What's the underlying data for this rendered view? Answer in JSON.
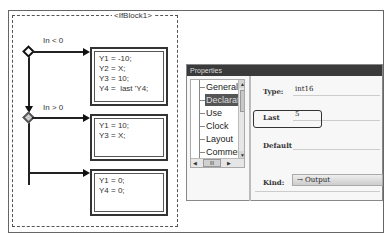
{
  "diagram": {
    "block_label": "<IfBlock1>",
    "branches": [
      {
        "condition": "In < 0",
        "statements": [
          "Y1 = -10;",
          "Y2 = X;",
          "Y3 = 10;",
          "Y4 =  last 'Y4;"
        ]
      },
      {
        "condition": "In > 0",
        "statements": [
          "Y1 = 10;",
          "Y3 = X;"
        ]
      },
      {
        "condition": "",
        "statements": [
          "Y1 = 0;",
          "Y4 = 0;"
        ]
      }
    ]
  },
  "properties": {
    "title": "Properties",
    "tree_items": [
      "General",
      "Declaration",
      "Use",
      "Clock",
      "Layout",
      "Comment"
    ],
    "selected_item": "Declaration",
    "scroll_thumb_label": "III",
    "fields": {
      "type_label": "Type:",
      "type_value": "int16",
      "last_label": "Last",
      "last_value": "5",
      "default_label": "Default",
      "default_value": "",
      "kind_label": "Kind:",
      "kind_value": "→ Output"
    }
  }
}
